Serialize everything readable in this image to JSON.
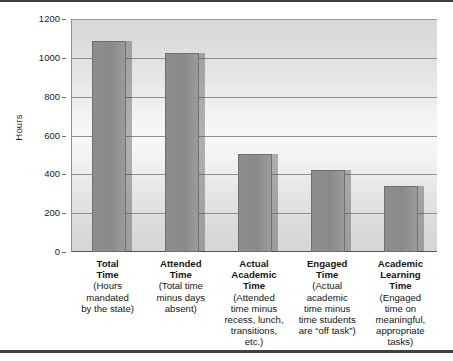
{
  "chart_data": {
    "type": "bar",
    "title": "",
    "xlabel": "",
    "ylabel": "Hours",
    "ylim": [
      0,
      1200
    ],
    "ytick_values": [
      0,
      200,
      400,
      600,
      800,
      1000,
      1200
    ],
    "ytick_labels": [
      "0",
      "200",
      "400",
      "600",
      "800",
      "1000",
      "1200"
    ],
    "grid": true,
    "legend": "none",
    "categories": [
      "Total Time",
      "Attended Time",
      "Actual Academic Time",
      "Engaged Time",
      "Academic Learning Time"
    ],
    "category_titles": [
      "Total\nTime",
      "Attended\nTime",
      "Actual\nAcademic\nTime",
      "Engaged\nTime",
      "Academic\nLearning\nTime"
    ],
    "category_subtitles": [
      "(Hours\nmandated\nby the state)",
      "(Total time\nminus days\nabsent)",
      "(Attended\ntime minus\nrecess, lunch,\ntransitions,\netc.)",
      "(Actual\nacademic\ntime minus\ntime students\nare “off task”)",
      "(Engaged\ntime on\nmeaningful,\nappropriate\ntasks)"
    ],
    "values": [
      1085,
      1025,
      505,
      422,
      340
    ],
    "bar_color": "#8a8a8a",
    "bar_border_color": "#6f6f6f",
    "shadow_color": "rgba(70,70,70,0.40)",
    "plot_background": "#ededed",
    "gridline_color": "#8f8f8f",
    "axis_color": "#55565a",
    "text_color": "#161616"
  },
  "axis": {
    "y_title": "Hours",
    "ticks": [
      {
        "label": "1200",
        "value": 1200
      },
      {
        "label": "1000",
        "value": 1000
      },
      {
        "label": "800",
        "value": 800
      },
      {
        "label": "600",
        "value": 600
      },
      {
        "label": "400",
        "value": 400
      },
      {
        "label": "200",
        "value": 200
      },
      {
        "label": "0",
        "value": 0
      }
    ]
  },
  "bars": [
    {
      "title_line1": "Total",
      "title_line2": "Time",
      "sub_line1": "(Hours",
      "sub_line2": "mandated",
      "sub_line3": "by the state)",
      "sub_line4": "",
      "sub_line5": "",
      "value": 1085
    },
    {
      "title_line1": "Attended",
      "title_line2": "Time",
      "title_line3": "",
      "sub_line1": "(Total time",
      "sub_line2": "minus days",
      "sub_line3": "absent)",
      "sub_line4": "",
      "sub_line5": "",
      "value": 1025
    },
    {
      "title_line1": "Actual",
      "title_line2": "Academic",
      "title_line3": "Time",
      "sub_line1": "(Attended",
      "sub_line2": "time minus",
      "sub_line3": "recess, lunch,",
      "sub_line4": "transitions,",
      "sub_line5": "etc.)",
      "value": 505
    },
    {
      "title_line1": "Engaged",
      "title_line2": "Time",
      "title_line3": "",
      "sub_line1": "(Actual",
      "sub_line2": "academic",
      "sub_line3": "time minus",
      "sub_line4": "time students",
      "sub_line5": "are “off task”)",
      "value": 422
    },
    {
      "title_line1": "Academic",
      "title_line2": "Learning",
      "title_line3": "Time",
      "sub_line1": "(Engaged",
      "sub_line2": "time on",
      "sub_line3": "meaningful,",
      "sub_line4": "appropriate",
      "sub_line5": "tasks)",
      "value": 340
    }
  ]
}
